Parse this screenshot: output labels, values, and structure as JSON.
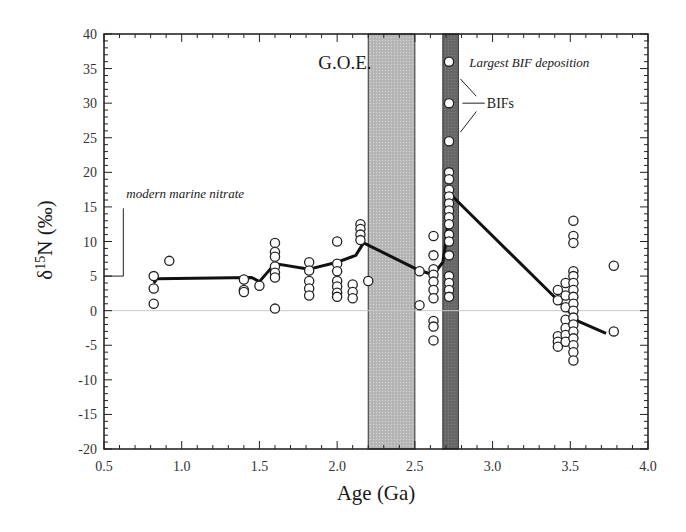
{
  "chart_data": {
    "type": "scatter",
    "title": "",
    "xlabel": "Age (Ga)",
    "ylabel": "δ15N (‰)",
    "xlim": [
      0.5,
      4.0
    ],
    "ylim": [
      -20,
      40
    ],
    "x_ticks": [
      "0.5",
      "1.0",
      "1.5",
      "2.0",
      "2.5",
      "3.0",
      "3.5",
      "4.0"
    ],
    "y_ticks": [
      "40",
      "35",
      "30",
      "25",
      "20",
      "15",
      "10",
      "5",
      "0",
      "-5",
      "-10",
      "-15",
      "-20"
    ],
    "grid": false,
    "zero_line": true,
    "shaded_regions": [
      {
        "name": "G.O.E.",
        "x_start": 2.2,
        "x_end": 2.5,
        "color": "#b8b8b8"
      },
      {
        "name": "Largest BIF deposition",
        "x_start": 2.68,
        "x_end": 2.78,
        "color": "#6e6e6e"
      }
    ],
    "annotations": [
      {
        "text": "G.O.E.",
        "x": 2.05,
        "y": 35
      },
      {
        "text": "Largest BIF deposition",
        "x": 2.85,
        "y": 36
      },
      {
        "text": "BIFs",
        "x": 2.95,
        "y": 30
      },
      {
        "text": "modern marine nitrate",
        "x": 0.65,
        "y": 17,
        "marker_level": 5
      }
    ],
    "series": [
      {
        "name": "samples",
        "style": "open-circle",
        "points": [
          [
            0.82,
            5
          ],
          [
            0.82,
            3.2
          ],
          [
            0.82,
            1
          ],
          [
            0.92,
            7.2
          ],
          [
            1.4,
            4.5
          ],
          [
            1.4,
            3
          ],
          [
            1.4,
            2.7
          ],
          [
            1.5,
            3.6
          ],
          [
            1.6,
            9.8
          ],
          [
            1.6,
            8.5
          ],
          [
            1.6,
            7.8
          ],
          [
            1.6,
            6.4
          ],
          [
            1.6,
            5.5
          ],
          [
            1.6,
            4.8
          ],
          [
            1.6,
            0.3
          ],
          [
            1.82,
            7
          ],
          [
            1.82,
            5.8
          ],
          [
            1.82,
            4.3
          ],
          [
            1.82,
            3.2
          ],
          [
            1.82,
            2.2
          ],
          [
            2.0,
            10
          ],
          [
            2.0,
            6.8
          ],
          [
            2.0,
            5.7
          ],
          [
            2.0,
            4.3
          ],
          [
            2.0,
            3.5
          ],
          [
            2.0,
            2.6
          ],
          [
            2.0,
            2
          ],
          [
            2.1,
            3.8
          ],
          [
            2.1,
            2.7
          ],
          [
            2.1,
            1.8
          ],
          [
            2.15,
            12.5
          ],
          [
            2.15,
            11.8
          ],
          [
            2.15,
            11
          ],
          [
            2.15,
            10.2
          ],
          [
            2.2,
            4.3
          ],
          [
            2.53,
            5.7
          ],
          [
            2.53,
            0.8
          ],
          [
            2.62,
            10.8
          ],
          [
            2.62,
            8
          ],
          [
            2.62,
            6
          ],
          [
            2.62,
            5.2
          ],
          [
            2.62,
            4.2
          ],
          [
            2.62,
            3
          ],
          [
            2.62,
            1.8
          ],
          [
            2.62,
            -1.5
          ],
          [
            2.62,
            -2.3
          ],
          [
            2.62,
            -4.3
          ],
          [
            2.72,
            36
          ],
          [
            2.72,
            30
          ],
          [
            2.72,
            24.5
          ],
          [
            2.72,
            20
          ],
          [
            2.72,
            19
          ],
          [
            2.72,
            17.5
          ],
          [
            2.72,
            16.5
          ],
          [
            2.72,
            15.5
          ],
          [
            2.72,
            14.5
          ],
          [
            2.72,
            13.5
          ],
          [
            2.72,
            12.5
          ],
          [
            2.72,
            11
          ],
          [
            2.72,
            10
          ],
          [
            2.72,
            8
          ],
          [
            2.72,
            5
          ],
          [
            2.72,
            4
          ],
          [
            2.72,
            3
          ],
          [
            2.72,
            2
          ],
          [
            3.42,
            3
          ],
          [
            3.42,
            1.5
          ],
          [
            3.42,
            -3.7
          ],
          [
            3.42,
            -4.5
          ],
          [
            3.42,
            -5.2
          ],
          [
            3.47,
            4
          ],
          [
            3.47,
            2.2
          ],
          [
            3.47,
            0.5
          ],
          [
            3.47,
            -1.3
          ],
          [
            3.47,
            -2.5
          ],
          [
            3.47,
            -3.5
          ],
          [
            3.47,
            -4.5
          ],
          [
            3.52,
            13
          ],
          [
            3.52,
            10.8
          ],
          [
            3.52,
            9.8
          ],
          [
            3.52,
            5.7
          ],
          [
            3.52,
            5
          ],
          [
            3.52,
            4
          ],
          [
            3.52,
            3
          ],
          [
            3.52,
            2
          ],
          [
            3.52,
            1
          ],
          [
            3.52,
            0
          ],
          [
            3.52,
            -1
          ],
          [
            3.52,
            -2
          ],
          [
            3.52,
            -3
          ],
          [
            3.52,
            -4
          ],
          [
            3.52,
            -5
          ],
          [
            3.52,
            -6
          ],
          [
            3.52,
            -7.2
          ],
          [
            3.78,
            6.5
          ],
          [
            3.78,
            -3
          ]
        ]
      },
      {
        "name": "trend",
        "style": "line",
        "points": [
          [
            0.82,
            4
          ],
          [
            0.84,
            4.6
          ],
          [
            1.45,
            4.8
          ],
          [
            1.5,
            4.2
          ],
          [
            1.6,
            6.8
          ],
          [
            1.82,
            6
          ],
          [
            2.0,
            7
          ],
          [
            2.12,
            8
          ],
          [
            2.17,
            9.8
          ],
          [
            2.53,
            5.8
          ],
          [
            2.62,
            5.2
          ],
          [
            2.68,
            7
          ],
          [
            2.7,
            10
          ],
          [
            2.73,
            16.8
          ],
          [
            3.42,
            1.5
          ],
          [
            3.55,
            -1.5
          ],
          [
            3.73,
            -3.3
          ]
        ]
      }
    ]
  }
}
